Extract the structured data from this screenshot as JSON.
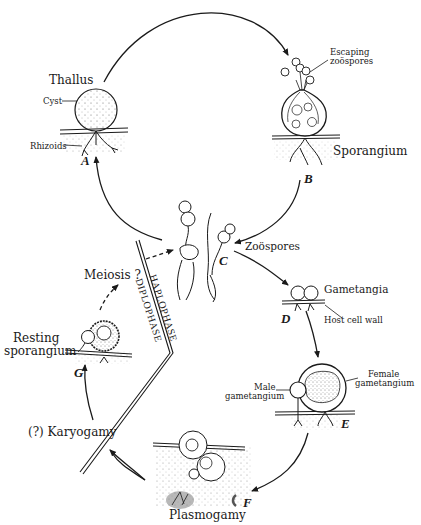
{
  "diagram": {
    "type": "life-cycle",
    "stages": [
      {
        "id": "A",
        "letter": "A",
        "title": "Thallus",
        "parts": [
          "Cyst",
          "Rhizoids"
        ]
      },
      {
        "id": "B",
        "letter": "B",
        "title": "Sporangium",
        "parts": [
          "Escaping zoöspores"
        ]
      },
      {
        "id": "C",
        "letter": "C",
        "title": "Zoöspores"
      },
      {
        "id": "D",
        "letter": "D",
        "title": "Gametangia",
        "parts": [
          "Host cell wall"
        ]
      },
      {
        "id": "E",
        "letter": "E",
        "parts": [
          "Male gametangium",
          "Female gametangium"
        ]
      },
      {
        "id": "F",
        "letter": "F",
        "title": "Plasmogamy"
      },
      {
        "id": "G",
        "letter": "G",
        "title": "Resting sporangium"
      }
    ],
    "transitions": [
      "(?) Karyogamy",
      "Meiosis ?"
    ],
    "phases": {
      "haplo": "HAPLOPHASE",
      "diplo": "DIPLOPHASE"
    }
  },
  "labels": {
    "thallus": "Thallus",
    "cyst": "Cyst",
    "rhizoids": "Rhizoids",
    "letter_a": "A",
    "escaping_1": "Escaping",
    "escaping_2": "zoöspores",
    "sporangium": "Sporangium",
    "letter_b": "B",
    "zoospores": "Zoöspores",
    "letter_c": "C",
    "gametangia": "Gametangia",
    "host_cell_wall": "Host cell wall",
    "letter_d": "D",
    "male_1": "Male",
    "male_2": "gametangium",
    "female_1": "Female",
    "female_2": "gametangium",
    "letter_e": "E",
    "plasmogamy": "Plasmogamy",
    "letter_f": "F",
    "karyogamy": "(?) Karyogamy",
    "resting_1": "Resting",
    "resting_2": "sporangium",
    "letter_g": "G",
    "meiosis": "Meiosis ?",
    "haplophase": "HAPLOPHASE",
    "diplophase": "DIPLOPHASE"
  }
}
